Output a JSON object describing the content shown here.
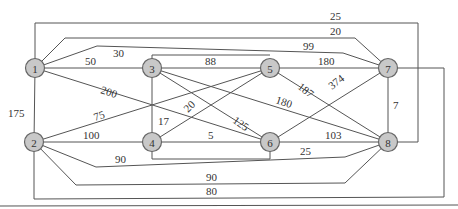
{
  "colors": {
    "node_fill": "#c8c8c8",
    "node_stroke": "#666666",
    "edge": "#555555",
    "text": "#333333"
  },
  "nodes": [
    {
      "id": "1",
      "x": 35,
      "y": 68
    },
    {
      "id": "2",
      "x": 34,
      "y": 142
    },
    {
      "id": "3",
      "x": 152,
      "y": 68
    },
    {
      "id": "4",
      "x": 152,
      "y": 142
    },
    {
      "id": "5",
      "x": 270,
      "y": 68
    },
    {
      "id": "6",
      "x": 270,
      "y": 142
    },
    {
      "id": "7",
      "x": 388,
      "y": 68
    },
    {
      "id": "8",
      "x": 388,
      "y": 142
    }
  ],
  "edges": [
    {
      "from": "1",
      "to": "8",
      "weight": "25",
      "points": "35,68 35,23 418,23 418,142 388,142",
      "lx": 330,
      "ly": 20,
      "rot": 0
    },
    {
      "from": "1",
      "to": "7",
      "weight": "20",
      "points": "35,68 65,38 355,38 388,68",
      "lx": 330,
      "ly": 35,
      "rot": 0
    },
    {
      "from": "1",
      "to": "7",
      "weight": "30",
      "points": "35,68 97,46 343,53 388,68",
      "lx": 113,
      "ly": 57,
      "rot": 0
    },
    {
      "from": "3",
      "to": "7",
      "weight": "99",
      "points": "152,68 152,55 270,55",
      "lx": 303,
      "ly": 50,
      "rot": 0
    },
    {
      "from": "1",
      "to": "3",
      "weight": "50",
      "points": "35,68 152,68",
      "lx": 85,
      "ly": 65,
      "rot": 0
    },
    {
      "from": "1",
      "to": "6",
      "weight": "200",
      "points": "35,68 270,142",
      "lx": 100,
      "ly": 93,
      "rot": 18
    },
    {
      "from": "1",
      "to": "2",
      "weight": "175",
      "points": "35,68 34,142",
      "lx": 8,
      "ly": 117,
      "rot": 0
    },
    {
      "from": "3",
      "to": "5",
      "weight": "88",
      "points": "152,68 270,68",
      "lx": 205,
      "ly": 65,
      "rot": 0
    },
    {
      "from": "3",
      "to": "4",
      "weight": "17",
      "points": "152,68 152,142",
      "lx": 158,
      "ly": 125,
      "rot": 0
    },
    {
      "from": "3",
      "to": "6",
      "weight": "125",
      "points": "152,68 270,142",
      "lx": 232,
      "ly": 122,
      "rot": 35
    },
    {
      "from": "3",
      "to": "8",
      "weight": "180",
      "points": "152,68 388,142",
      "lx": 275,
      "ly": 103,
      "rot": 18
    },
    {
      "from": "5",
      "to": "7",
      "weight": "180",
      "points": "270,68 388,68",
      "lx": 318,
      "ly": 65,
      "rot": 0
    },
    {
      "from": "5",
      "to": "8",
      "weight": "187",
      "points": "270,68 329,105 388,142",
      "lx": 297,
      "ly": 88,
      "rot": 38
    },
    {
      "from": "6",
      "to": "7",
      "weight": "374",
      "points": "270,142 388,68",
      "lx": 332,
      "ly": 90,
      "rot": -38
    },
    {
      "from": "2",
      "to": "5",
      "weight": "75",
      "points": "34,142 270,68",
      "lx": 95,
      "ly": 121,
      "rot": -18
    },
    {
      "from": "4",
      "to": "5",
      "weight": "20",
      "points": "152,142 270,68",
      "lx": 188,
      "ly": 113,
      "rot": -45
    },
    {
      "from": "2",
      "to": "4",
      "weight": "100",
      "points": "34,142 152,142",
      "lx": 83,
      "ly": 139,
      "rot": 0
    },
    {
      "from": "4",
      "to": "6",
      "weight": "5",
      "points": "152,142 270,142",
      "lx": 208,
      "ly": 139,
      "rot": 0
    },
    {
      "from": "4",
      "to": "6",
      "weight": "",
      "points": "152,142 152,159 270,159 270,142",
      "lx": 0,
      "ly": 0,
      "rot": 0
    },
    {
      "from": "6",
      "to": "8",
      "weight": "103",
      "points": "270,142 388,142",
      "lx": 325,
      "ly": 139,
      "rot": 0
    },
    {
      "from": "7",
      "to": "8",
      "weight": "7",
      "points": "388,68 388,142",
      "lx": 393,
      "ly": 109,
      "rot": 0
    },
    {
      "from": "2",
      "to": "8",
      "weight": "90",
      "points": "34,142 96,167 345,157 388,142",
      "lx": 115,
      "ly": 163,
      "rot": 0
    },
    {
      "from": "2",
      "to": "8",
      "weight": "25",
      "points": "34,142 76,185 345,183 388,142",
      "lx": 300,
      "ly": 155,
      "rot": 0
    },
    {
      "from": "2",
      "to": "8",
      "weight": "90",
      "points": "",
      "lx": 206,
      "ly": 181,
      "rot": 0
    },
    {
      "from": "2",
      "to": "7",
      "weight": "80",
      "points": "34,142 34,199 444,197 444,68 388,68",
      "lx": 206,
      "ly": 195,
      "rot": 0
    }
  ]
}
